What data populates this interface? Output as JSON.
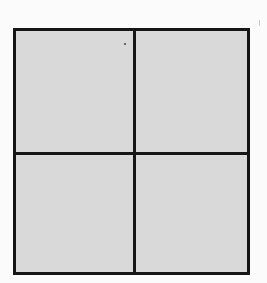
{
  "diagram": {
    "type": "grid",
    "rows": 2,
    "cols": 2,
    "cells": [
      {
        "row": 0,
        "col": 0,
        "label": ""
      },
      {
        "row": 0,
        "col": 1,
        "label": ""
      },
      {
        "row": 1,
        "col": 0,
        "label": ""
      },
      {
        "row": 1,
        "col": 1,
        "label": ""
      }
    ],
    "colors": {
      "fill": "#d9d9d9",
      "border": "#161616",
      "background": "#fbfbfb"
    }
  }
}
